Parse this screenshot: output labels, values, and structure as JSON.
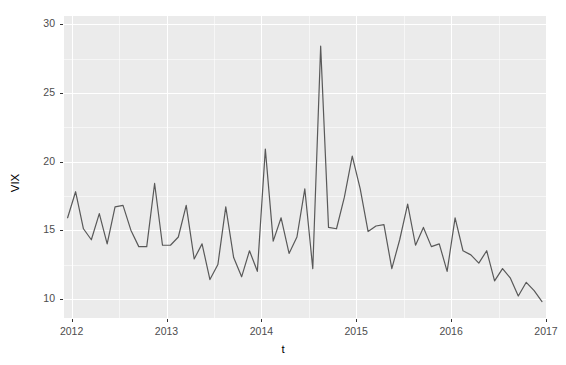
{
  "chart_data": {
    "type": "line",
    "title": "",
    "xlabel": "t",
    "ylabel": "VIX",
    "xlim": [
      2011.92,
      2017.0
    ],
    "ylim": [
      8.6,
      30.6
    ],
    "grid": true,
    "legend": "none",
    "line_color": "#595959",
    "panel_background": "#ebebeb",
    "gridline_color": "#ffffff",
    "x_ticks": [
      2012,
      2013,
      2014,
      2015,
      2016,
      2017
    ],
    "x_tick_labels": [
      "2012",
      "2013",
      "2014",
      "2015",
      "2016",
      "2017"
    ],
    "y_ticks": [
      10,
      15,
      20,
      25,
      30
    ],
    "y_tick_labels": [
      "10",
      "15",
      "20",
      "25",
      "30"
    ],
    "series": [
      {
        "name": "VIX",
        "x": [
          2011.958,
          2012.042,
          2012.125,
          2012.208,
          2012.292,
          2012.375,
          2012.458,
          2012.542,
          2012.625,
          2012.708,
          2012.792,
          2012.875,
          2012.958,
          2013.042,
          2013.125,
          2013.208,
          2013.292,
          2013.375,
          2013.458,
          2013.542,
          2013.625,
          2013.708,
          2013.792,
          2013.875,
          2013.958,
          2014.042,
          2014.125,
          2014.208,
          2014.292,
          2014.375,
          2014.458,
          2014.542,
          2014.625,
          2014.708,
          2014.792,
          2014.875,
          2014.958,
          2015.042,
          2015.125,
          2015.208,
          2015.292,
          2015.375,
          2015.458,
          2015.542,
          2015.625,
          2015.708,
          2015.792,
          2015.875,
          2015.958,
          2016.042,
          2016.125,
          2016.208,
          2016.292,
          2016.375,
          2016.458,
          2016.542,
          2016.625,
          2016.708,
          2016.792,
          2016.875,
          2016.958
        ],
        "values": [
          15.9,
          17.8,
          15.1,
          14.3,
          16.2,
          14.0,
          16.7,
          16.8,
          15.0,
          13.8,
          13.8,
          18.4,
          13.9,
          13.9,
          14.5,
          16.8,
          12.9,
          14.0,
          11.4,
          12.5,
          16.7,
          13.0,
          11.6,
          13.5,
          12.0,
          20.9,
          14.2,
          15.9,
          13.3,
          14.5,
          18.0,
          12.2,
          28.4,
          15.2,
          15.1,
          17.4,
          20.4,
          18.0,
          14.9,
          15.3,
          15.4,
          12.2,
          14.3,
          16.9,
          13.9,
          15.2,
          13.8,
          14.0,
          12.0,
          15.9,
          13.5,
          13.2,
          12.6,
          13.5,
          11.3,
          12.2,
          11.5,
          10.2,
          11.2,
          10.6,
          9.8
        ]
      }
    ]
  },
  "axes": {
    "y_title": "VIX",
    "x_title": "t"
  }
}
